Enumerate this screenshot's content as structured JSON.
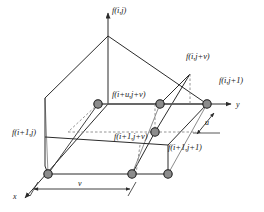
{
  "figure": {
    "background_color": "#ffffff",
    "line_color": "#2b2b2b",
    "node_fill_color": "#8c8c8c",
    "node_stroke_color": "#1a1a1a",
    "dashed_color": "#777777"
  },
  "axes": [
    {
      "id": "axis-f",
      "label": "f(i,j)",
      "direction": "up"
    },
    {
      "id": "axis-y",
      "label": "y",
      "direction": "right"
    },
    {
      "id": "axis-x",
      "label": "x",
      "direction": "lower-left"
    }
  ],
  "dimensions": [
    {
      "id": "dim-v",
      "label": "v",
      "orientation": "horizontal"
    },
    {
      "id": "dim-u",
      "label": "u",
      "orientation": "diagonal"
    }
  ],
  "nodes": [
    {
      "id": "node-top-back-left",
      "label": "",
      "x": 98,
      "y": 104
    },
    {
      "id": "node-top-mid",
      "label": "f(i+u,j+v)",
      "x": 160,
      "y": 104
    },
    {
      "id": "node-top-right",
      "label": "f(i,j+1)",
      "x": 207,
      "y": 104
    },
    {
      "id": "node-interior",
      "label": "f(i+1,j+v)",
      "x": 155,
      "y": 132
    },
    {
      "id": "node-bottom-left",
      "label": "f(i+1,j)",
      "x": 48,
      "y": 174
    },
    {
      "id": "node-bottom-mid",
      "label": "",
      "x": 132,
      "y": 174
    },
    {
      "id": "node-bottom-right",
      "label": "f(i+1,j+1)",
      "x": 168,
      "y": 174
    }
  ],
  "labels": {
    "f_i_j": "f(i,j)",
    "f_i_jv": "f(i,j+v)",
    "f_i_j1": "f(i,j+1)",
    "f_iu_jv": "f(i+u,j+v)",
    "f_i1_j": "f(i+1,j)",
    "f_i1_jv": "f(i+1,j+v)",
    "f_i1_j1": "f(i+1,j+1)",
    "axis_y": "y",
    "axis_x": "x",
    "dim_v": "v",
    "dim_u": "u"
  }
}
